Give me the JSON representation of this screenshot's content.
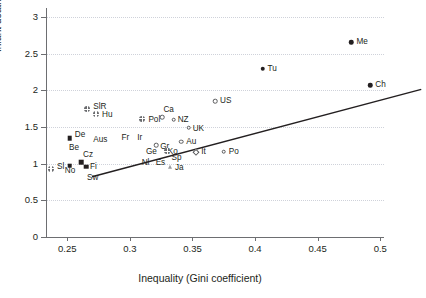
{
  "chart_data": {
    "type": "scatter",
    "title": "",
    "xlabel": "Inequality (Gini coefficient)",
    "ylabel": "Infant deaths/1,000 (log scale)",
    "xlim": [
      0.233,
      0.503
    ],
    "ylim": [
      0,
      3.12
    ],
    "xticks": [
      "0.25",
      "0.3",
      "0.35",
      "0.4",
      "0.45",
      "0.5"
    ],
    "xtick_values": [
      0.25,
      0.3,
      0.35,
      0.4,
      0.45,
      0.5
    ],
    "yticks": [
      "0",
      "0.5",
      "1",
      "1.5",
      "2",
      "2.5",
      "3"
    ],
    "ytick_values": [
      0,
      0.5,
      1,
      1.5,
      2,
      2.5,
      3
    ],
    "grid": "horizontal-dotted",
    "legend": "none",
    "trendline": {
      "x0": 0.233,
      "y0": 0.93,
      "x1": 0.496,
      "y1": 2.12,
      "color": "#231f20"
    },
    "points": [
      {
        "label": "Sl",
        "x": 0.237,
        "y": 0.93,
        "marker": "cross",
        "lx": 6,
        "ly": -2
      },
      {
        "label": "No",
        "x": 0.252,
        "y": 0.97,
        "marker": "fsquare",
        "lx": -5,
        "ly": 5
      },
      {
        "label": "De",
        "x": 0.252,
        "y": 1.35,
        "marker": "fsquare",
        "lx": 5,
        "ly": -3
      },
      {
        "label": "Be",
        "x": 0.253,
        "y": 1.26,
        "marker": "none",
        "lx": -2,
        "ly": 3
      },
      {
        "label": "Cz",
        "x": 0.261,
        "y": 1.02,
        "marker": "fsquare",
        "lx": 2,
        "ly": -7
      },
      {
        "label": "Fi",
        "x": 0.265,
        "y": 0.96,
        "marker": "fsquare",
        "lx": 4,
        "ly": 0
      },
      {
        "label": "Sw",
        "x": 0.265,
        "y": 0.88,
        "marker": "none",
        "lx": 1,
        "ly": 6
      },
      {
        "label": "SlR",
        "x": 0.266,
        "y": 1.74,
        "marker": "cross",
        "lx": 6,
        "ly": -2
      },
      {
        "label": "Aus",
        "x": 0.27,
        "y": 1.32,
        "marker": "none",
        "lx": 1,
        "ly": 0
      },
      {
        "label": "Hu",
        "x": 0.273,
        "y": 1.67,
        "marker": "cross",
        "lx": 6,
        "ly": 1
      },
      {
        "label": "Fr",
        "x": 0.295,
        "y": 1.34,
        "marker": "none",
        "lx": -2,
        "ly": -1
      },
      {
        "label": "Ir",
        "x": 0.305,
        "y": 1.33,
        "marker": "none",
        "lx": 1,
        "ly": -1
      },
      {
        "label": "Pol",
        "x": 0.31,
        "y": 1.61,
        "marker": "cross",
        "lx": 6,
        "ly": 1
      },
      {
        "label": "Ge",
        "x": 0.312,
        "y": 1.2,
        "marker": "none",
        "lx": 1,
        "ly": 3
      },
      {
        "label": "Nl",
        "x": 0.311,
        "y": 1.13,
        "marker": "none",
        "lx": -2,
        "ly": 9
      },
      {
        "label": "Gr",
        "x": 0.321,
        "y": 1.25,
        "marker": "ocircle",
        "lx": 4,
        "ly": 2
      },
      {
        "label": "Ca",
        "x": 0.326,
        "y": 1.63,
        "marker": "ocircle",
        "lx": 1,
        "ly": -7
      },
      {
        "label": "Es",
        "x": 0.323,
        "y": 1.13,
        "marker": "none",
        "lx": -3,
        "ly": 9
      },
      {
        "label": "Ko",
        "x": 0.327,
        "y": 1.21,
        "marker": "none",
        "lx": 4,
        "ly": 4
      },
      {
        "label": "Sp",
        "x": 0.33,
        "y": 1.17,
        "marker": "cross",
        "lx": 4,
        "ly": 7
      },
      {
        "label": "NZ",
        "x": 0.335,
        "y": 1.6,
        "marker": "ocircle",
        "lx": 4,
        "ly": 0
      },
      {
        "label": "Ja",
        "x": 0.332,
        "y": 0.95,
        "marker": "tri",
        "lx": 5,
        "ly": 1
      },
      {
        "label": "Au",
        "x": 0.341,
        "y": 1.3,
        "marker": "ocircle",
        "lx": 5,
        "ly": 0
      },
      {
        "label": "UK",
        "x": 0.347,
        "y": 1.49,
        "marker": "ocircle",
        "lx": 4,
        "ly": 1
      },
      {
        "label": "It",
        "x": 0.353,
        "y": 1.16,
        "marker": "diamond",
        "lx": 5,
        "ly": 0
      },
      {
        "label": "US",
        "x": 0.368,
        "y": 1.85,
        "marker": "ocircle",
        "lx": 5,
        "ly": 0
      },
      {
        "label": "Po",
        "x": 0.375,
        "y": 1.16,
        "marker": "ocircle",
        "lx": 5,
        "ly": 0
      },
      {
        "label": "Tu",
        "x": 0.406,
        "y": 2.29,
        "marker": "fcircle",
        "lx": 5,
        "ly": 0
      },
      {
        "label": "Me",
        "x": 0.477,
        "y": 2.65,
        "marker": "fcircle",
        "lx": 5,
        "ly": 0
      },
      {
        "label": "Ch",
        "x": 0.492,
        "y": 2.07,
        "marker": "fcircle",
        "lx": 5,
        "ly": 0
      }
    ]
  }
}
